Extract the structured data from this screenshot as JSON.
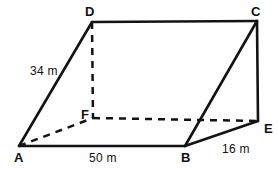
{
  "figure": {
    "background_color": "#fefefe",
    "stroke_color": "#131313",
    "vertices": [
      {
        "id": "A",
        "label": "A",
        "x": 19,
        "y": 146
      },
      {
        "id": "B",
        "label": "B",
        "x": 185,
        "y": 146
      },
      {
        "id": "C",
        "label": "C",
        "x": 257,
        "y": 21
      },
      {
        "id": "D",
        "label": "D",
        "x": 92,
        "y": 22
      },
      {
        "id": "E",
        "label": "E",
        "x": 258,
        "y": 121
      },
      {
        "id": "F",
        "label": "F",
        "x": 93,
        "y": 118
      }
    ],
    "edges_solid": [
      {
        "from": "A",
        "to": "D"
      },
      {
        "from": "D",
        "to": "C"
      },
      {
        "from": "C",
        "to": "E"
      },
      {
        "from": "E",
        "to": "B"
      },
      {
        "from": "B",
        "to": "A"
      },
      {
        "from": "B",
        "to": "C"
      }
    ],
    "edges_dashed": [
      {
        "from": "D",
        "to": "F"
      },
      {
        "from": "A",
        "to": "F"
      },
      {
        "from": "F",
        "to": "E"
      }
    ],
    "measurements": [
      {
        "id": "ad",
        "edge": "A-D",
        "text": "34 m",
        "x": 30,
        "y": 65
      },
      {
        "id": "ab",
        "edge": "A-B",
        "text": "50 m",
        "x": 89,
        "y": 152
      },
      {
        "id": "be",
        "edge": "B-E",
        "text": "16 m",
        "x": 222,
        "y": 143
      }
    ],
    "vertex_label_positions": {
      "A": {
        "x": 14,
        "y": 151
      },
      "B": {
        "x": 181,
        "y": 151
      },
      "C": {
        "x": 251,
        "y": 5
      },
      "D": {
        "x": 85,
        "y": 5
      },
      "E": {
        "x": 264,
        "y": 122
      },
      "F": {
        "x": 81,
        "y": 108
      }
    }
  }
}
